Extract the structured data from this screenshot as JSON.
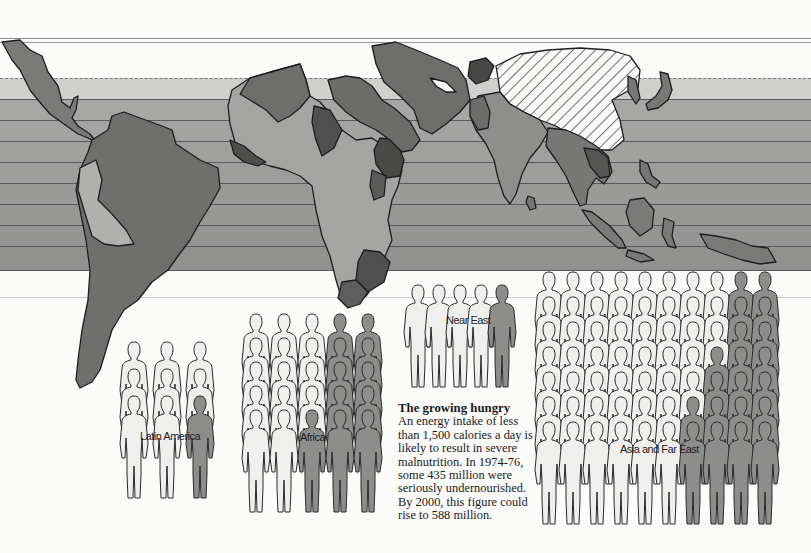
{
  "caption": {
    "title": "The growing hungry",
    "body": "An energy intake of less than 1,500 calories a day is likely to result in severe malnutrition. In 1974-76, some 435 million were seriously undernourished. By 2000, this figure could rise to 588 million."
  },
  "regions": [
    {
      "id": "latin-america",
      "label": "Latin America",
      "cols": 3,
      "rows": 3,
      "shaded_count": 1
    },
    {
      "id": "africa",
      "label": "Africa",
      "cols": 5,
      "rows": 5,
      "shaded_count": 11
    },
    {
      "id": "near-east",
      "label": "Near East",
      "cols": 5,
      "rows": 1,
      "shaded_count": 1
    },
    {
      "id": "asia-far-east",
      "label": "Asia and Far East",
      "cols": 10,
      "rows": 7,
      "shaded_count": 20
    }
  ],
  "map": {
    "hatched_region": "china",
    "band_count": 9
  },
  "colors": {
    "background": "#fbfbfa",
    "band_light": "#c9c9c7",
    "band_dark": "#8f8f8d",
    "land_dark": "#6f6f6d",
    "land_mid": "#8c8c8a",
    "land_light": "#b3b3b1",
    "land_darkest": "#4e4e4c",
    "figure_fill": "#efefed",
    "figure_shaded": "#8d8d8b"
  }
}
